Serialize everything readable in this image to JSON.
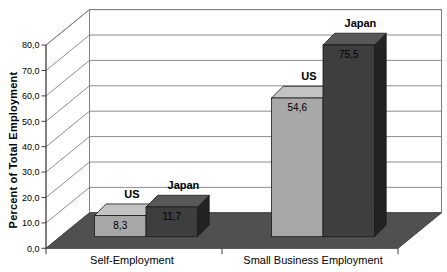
{
  "chart_data": {
    "type": "bar",
    "variant": "3d-clustered-column",
    "title": "",
    "ylabel": "Percent of Total Employment",
    "xlabel": "",
    "categories": [
      "Self-Employment",
      "Small Business Employment"
    ],
    "series": [
      {
        "name": "US",
        "values": [
          8.3,
          54.6
        ]
      },
      {
        "name": "Japan",
        "values": [
          11.7,
          75.5
        ]
      }
    ],
    "value_labels": [
      [
        "8,3",
        "54,6"
      ],
      [
        "11,7",
        "75,5"
      ]
    ],
    "ylim": [
      0,
      80
    ],
    "ytick_step": 10,
    "ytick_labels": [
      "0,0",
      "10,0",
      "20,0",
      "30,0",
      "40,0",
      "50,0",
      "60,0",
      "70,0",
      "80,0"
    ],
    "grid": true,
    "legend_position": "none",
    "colors": {
      "us_front": "#a8a8a8",
      "us_top": "#c3c3c3",
      "us_side": "#8a8a8a",
      "japan_front": "#3e3e3e",
      "japan_top": "#585858",
      "japan_side": "#232323",
      "floor": "#505050",
      "wall": "#ffffff",
      "gridline": "#808080",
      "axis": "#404040",
      "bar_outline": "#1a1a1a",
      "text": "#000000"
    }
  }
}
